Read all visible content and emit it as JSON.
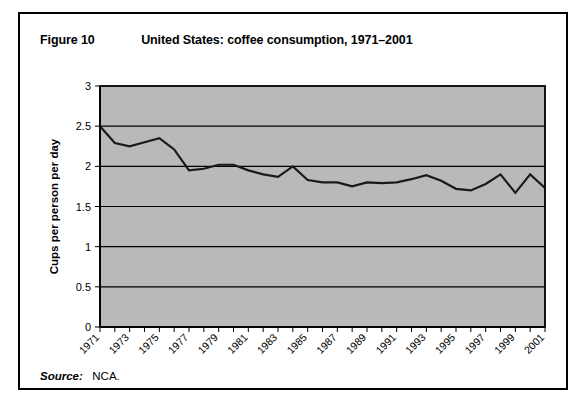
{
  "figure": {
    "number": "Figure 10",
    "title": "United States: coffee consumption, 1971–2001",
    "source_label": "Source:",
    "source_value": "NCA."
  },
  "chart_data": {
    "type": "line",
    "title": "United States: coffee consumption, 1971–2001",
    "xlabel": "",
    "ylabel": "Cups per person per day",
    "xlim": [
      1971,
      2001
    ],
    "ylim": [
      0,
      3
    ],
    "yticks": [
      0,
      0.5,
      1,
      1.5,
      2,
      2.5,
      3
    ],
    "ytick_labels": [
      "0",
      "0.5",
      "1",
      "1.5",
      "2",
      "2.5",
      "3"
    ],
    "xticks": [
      1971,
      1973,
      1975,
      1977,
      1979,
      1981,
      1983,
      1985,
      1987,
      1989,
      1991,
      1993,
      1995,
      1997,
      1999,
      2001
    ],
    "xtick_labels": [
      "1971",
      "1973",
      "1975",
      "1977",
      "1979",
      "1981",
      "1983",
      "1985",
      "1987",
      "1989",
      "1991",
      "1993",
      "1995",
      "1997",
      "1999",
      "2001"
    ],
    "grid": true,
    "grid_axis": "y",
    "legend": false,
    "plot_background": "#b9b9b9",
    "line_color": "#1a1a1a",
    "x": [
      1971,
      1972,
      1973,
      1974,
      1975,
      1976,
      1977,
      1978,
      1979,
      1980,
      1981,
      1982,
      1983,
      1984,
      1985,
      1986,
      1987,
      1988,
      1989,
      1990,
      1991,
      1992,
      1993,
      1994,
      1995,
      1996,
      1997,
      1998,
      1999,
      2000,
      2001
    ],
    "values": [
      2.5,
      2.29,
      2.25,
      2.3,
      2.35,
      2.21,
      1.95,
      1.97,
      2.02,
      2.02,
      1.95,
      1.9,
      1.87,
      2.0,
      1.83,
      1.8,
      1.8,
      1.75,
      1.8,
      1.79,
      1.8,
      1.84,
      1.89,
      1.82,
      1.72,
      1.7,
      1.78,
      1.9,
      1.67,
      1.9,
      1.73
    ],
    "series": [
      {
        "name": "Cups per person per day",
        "values": [
          2.5,
          2.29,
          2.25,
          2.3,
          2.35,
          2.21,
          1.95,
          1.97,
          2.02,
          2.02,
          1.95,
          1.9,
          1.87,
          2.0,
          1.83,
          1.8,
          1.8,
          1.75,
          1.8,
          1.79,
          1.8,
          1.84,
          1.89,
          1.82,
          1.72,
          1.7,
          1.78,
          1.9,
          1.67,
          1.9,
          1.73
        ]
      }
    ]
  }
}
